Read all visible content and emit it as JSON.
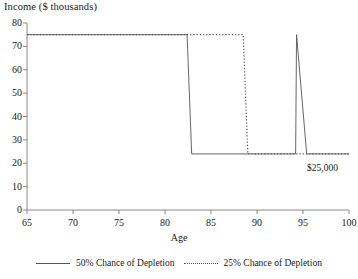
{
  "chart_data": {
    "type": "line",
    "title": "Income ($ thousands)",
    "xlabel": "Age",
    "ylabel": "Income ($ thousands)",
    "xlim": [
      65,
      100
    ],
    "ylim": [
      0,
      80
    ],
    "xticks": [
      65,
      70,
      75,
      80,
      85,
      90,
      95,
      100
    ],
    "yticks": [
      0,
      10,
      20,
      30,
      40,
      50,
      60,
      70,
      80
    ],
    "grid": false,
    "legend_position": "bottom",
    "annotations": [
      {
        "text": "$25,000",
        "x": 97.5,
        "y": 20
      }
    ],
    "series": [
      {
        "name": "50% Chance of Depletion",
        "style": "solid",
        "color": "#555555",
        "x": [
          65,
          82.4,
          82.9,
          94.2,
          94.3,
          95.4,
          100
        ],
        "values": [
          75,
          75,
          24,
          24,
          75,
          24,
          24
        ]
      },
      {
        "name": "25% Chance of Depletion",
        "style": "dotted",
        "color": "#555555",
        "x": [
          65,
          88.5,
          89.0,
          100
        ],
        "values": [
          75,
          75,
          24,
          24
        ]
      }
    ]
  },
  "axis": {
    "title_y": "Income ($ thousands)",
    "title_x": "Age",
    "ytick_labels": [
      "80",
      "70",
      "60",
      "50",
      "40",
      "30",
      "20",
      "10",
      "0"
    ],
    "xtick_labels": [
      "65",
      "70",
      "75",
      "80",
      "85",
      "90",
      "95",
      "100"
    ]
  },
  "annotation": {
    "value_label": "$25,000"
  },
  "legend": {
    "items": [
      {
        "label": "50% Chance of Depletion",
        "style": "solid"
      },
      {
        "label": "25% Chance of Depletion",
        "style": "dotted"
      }
    ]
  }
}
